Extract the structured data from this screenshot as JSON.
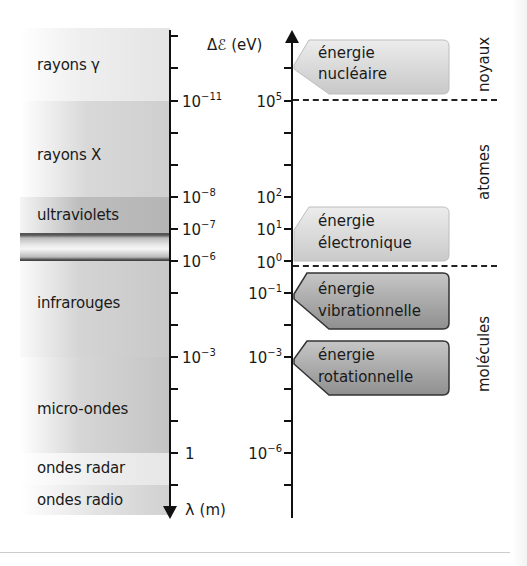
{
  "figure": {
    "left_axis": {
      "label_symbol": "λ",
      "label_unit": "(m)",
      "direction": "down",
      "ticks": [
        {
          "base": "10",
          "exp": "−11",
          "y": 101
        },
        {
          "base": "10",
          "exp": "−8",
          "y": 197
        },
        {
          "base": "10",
          "exp": "−7",
          "y": 229
        },
        {
          "base": "10",
          "exp": "−6",
          "y": 261
        },
        {
          "base": "10",
          "exp": "−3",
          "y": 357
        },
        {
          "base": "1",
          "exp": "",
          "y": 453
        }
      ]
    },
    "right_axis": {
      "label_symbol": "Δℰ",
      "label_unit": "(eV)",
      "direction": "up",
      "ticks": [
        {
          "base": "10",
          "exp": "5",
          "y": 101
        },
        {
          "base": "10",
          "exp": "2",
          "y": 197
        },
        {
          "base": "10",
          "exp": "1",
          "y": 229
        },
        {
          "base": "10",
          "exp": "0",
          "y": 261
        },
        {
          "base": "10",
          "exp": "−1",
          "y": 293
        },
        {
          "base": "10",
          "exp": "−3",
          "y": 357
        },
        {
          "base": "10",
          "exp": "−6",
          "y": 453
        }
      ]
    },
    "bands": [
      {
        "label": "rayons γ"
      },
      {
        "label": "rayons X"
      },
      {
        "label": "ultraviolets"
      },
      {
        "label": "infrarouges"
      },
      {
        "label": "micro-ondes"
      },
      {
        "label": "ondes radar"
      },
      {
        "label": "ondes radio"
      }
    ],
    "energy_boxes": [
      {
        "line1": "énergie",
        "line2": "nucléaire",
        "shade": "light"
      },
      {
        "line1": "énergie",
        "line2": "électronique",
        "shade": "light"
      },
      {
        "line1": "énergie",
        "line2": "vibrationnelle",
        "shade": "dark"
      },
      {
        "line1": "énergie",
        "line2": "rotationnelle",
        "shade": "dark"
      }
    ],
    "domains": [
      {
        "label": "noyaux"
      },
      {
        "label": "atomes"
      },
      {
        "label": "molécules"
      }
    ],
    "colors": {
      "axis": "#111111",
      "box_light": "#d9d9d9",
      "box_dark": "#a9a9a9",
      "band_gray": "#c4c4c4"
    }
  }
}
